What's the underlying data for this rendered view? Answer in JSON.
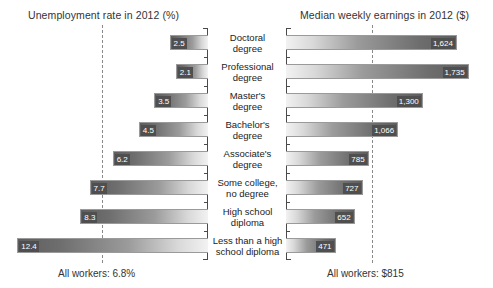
{
  "figure": {
    "left_panel_title": "Unemployment rate in 2012 (%)",
    "right_panel_title": "Median weekly earnings in 2012 ($)",
    "left_panel_footer": "All workers: 6.8%",
    "right_panel_footer": "All workers: $815"
  },
  "chart_data": {
    "type": "bar",
    "orientation": "horizontal",
    "layout": "back-to-back pyramid, two panels sharing centered category labels",
    "grid": false,
    "legend": "none",
    "categories": [
      "Doctoral degree",
      "Professional degree",
      "Master's degree",
      "Bachelor's degree",
      "Associate's degree",
      "Some college, no degree",
      "High school diploma",
      "Less than a high school diploma"
    ],
    "category_lines": [
      [
        "Doctoral",
        "degree"
      ],
      [
        "Professional",
        "degree"
      ],
      [
        "Master's",
        "degree"
      ],
      [
        "Bachelor's",
        "degree"
      ],
      [
        "Associate's",
        "degree"
      ],
      [
        "Some college,",
        "no degree"
      ],
      [
        "High school",
        "diploma"
      ],
      [
        "Less than a high",
        "school diploma"
      ]
    ],
    "series": [
      {
        "name": "Unemployment rate in 2012 (%)",
        "panel": "left",
        "direction": "right-to-left",
        "unit": "%",
        "xlabel": "Unemployment rate in 2012 (%)",
        "xlim": [
          0,
          13
        ],
        "values": [
          2.5,
          2.1,
          3.5,
          4.5,
          6.2,
          7.7,
          8.3,
          12.4
        ],
        "value_labels": [
          "2.5",
          "2.1",
          "3.5",
          "4.5",
          "6.2",
          "7.7",
          "8.3",
          "12.4"
        ],
        "reference_line": {
          "label": "All workers: 6.8%",
          "value": 6.8
        }
      },
      {
        "name": "Median weekly earnings in 2012 ($)",
        "panel": "right",
        "direction": "left-to-right",
        "unit": "$",
        "xlabel": "Median weekly earnings in 2012 ($)",
        "xlim": [
          0,
          1900
        ],
        "values": [
          1624,
          1735,
          1300,
          1066,
          785,
          727,
          652,
          471
        ],
        "value_labels": [
          "1,624",
          "1,735",
          "1,300",
          "1,066",
          "785",
          "727",
          "652",
          "471"
        ],
        "reference_line": {
          "label": "All workers: $815",
          "value": 815
        }
      }
    ]
  }
}
